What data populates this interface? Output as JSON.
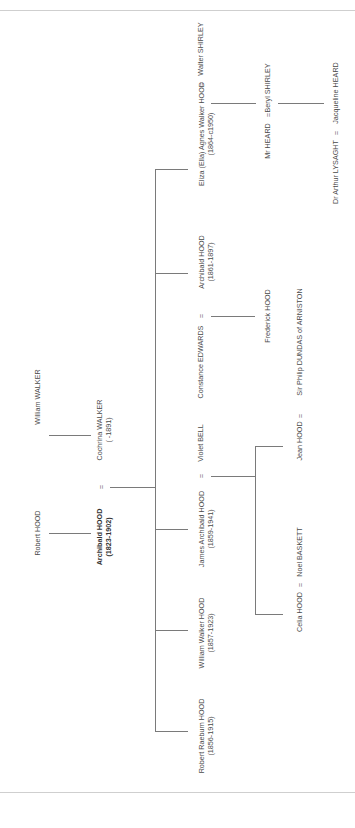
{
  "tree": {
    "generation1": {
      "robert_hood": "Robert HOOD",
      "william_walker": "William WALKER"
    },
    "generation2": {
      "archibald_hood": {
        "name": "Archibald HOOD",
        "dates": "(1823-1902)"
      },
      "marriage_symbol": "=",
      "cochrina_walker": {
        "name": "Cochrina WALKER",
        "dates": "( -1891)"
      }
    },
    "generation3": [
      {
        "name": "Eliza (Ella) Agnes Walker HOOD",
        "dates": "(1864-c1950)",
        "spouse": "Walter SHIRLEY",
        "spouse_first": false
      },
      {
        "name": "Archibald HOOD",
        "dates": "(1861-1897)",
        "spouse": "Constance EDWARDS",
        "spouse_first": true
      },
      {
        "name": "James Archibald HOOD",
        "dates": "(1859-1941)",
        "spouse": "Violet BELL",
        "spouse_first": false
      },
      {
        "name": "William Walker HOOD",
        "dates": "(1857-1923)"
      },
      {
        "name": "Robert Raeburn HOOD",
        "dates": "(1856-1915)"
      }
    ],
    "generation4": {
      "shirley_line": {
        "spouse": "Mr HEARD",
        "name": "Beryl SHIRLEY"
      },
      "archibald_line": {
        "name": "Frederick HOOD"
      },
      "james_line": [
        {
          "name": "Jean HOOD",
          "spouse": "Sir Philip DUNDAS of ARNISTON"
        },
        {
          "name": "Celia HOOD",
          "spouse": "Noel BASKETT"
        }
      ]
    },
    "generation5": {
      "heard_line": {
        "spouse": "Dr Arthur LYSAGHT",
        "name": "Jacqueline HEARD"
      }
    },
    "marriage_symbol": "="
  }
}
